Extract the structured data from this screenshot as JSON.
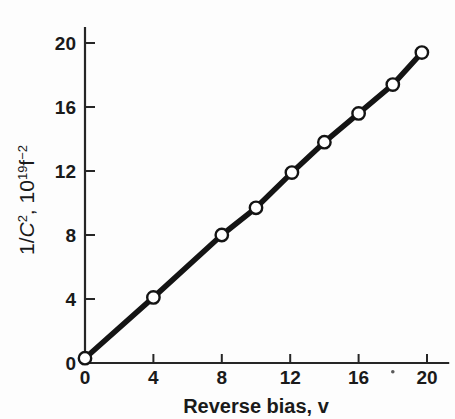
{
  "chart_data": {
    "type": "line",
    "title": "",
    "xlabel": "Reverse bias, v",
    "ylabel": "1/C², 10¹⁹ f⁻²",
    "ylabel_parts": {
      "one_slash": "1/",
      "c_italic": "C",
      "c_exp": "2",
      "comma": ", 10",
      "ten_exp": "19",
      "f": "f",
      "f_exp": "−2"
    },
    "xlim": [
      0,
      21.3
    ],
    "ylim": [
      0,
      21.0
    ],
    "xticks": [
      0,
      4,
      8,
      12,
      16,
      20
    ],
    "yticks": [
      0,
      4,
      8,
      12,
      16,
      20
    ],
    "xtick_labels": [
      "0",
      "4",
      "8",
      "12",
      "16",
      "20"
    ],
    "ytick_labels": [
      "0",
      "4",
      "8",
      "12",
      "16",
      "20"
    ],
    "grid": false,
    "legend": null,
    "series": [
      {
        "name": "1/C^2 vs reverse bias",
        "marker": "open-circle",
        "x": [
          0.0,
          4.0,
          8.0,
          10.0,
          12.1,
          14.0,
          16.0,
          18.0,
          19.7
        ],
        "y": [
          0.3,
          4.1,
          8.0,
          9.7,
          11.9,
          13.8,
          15.6,
          17.4,
          19.4
        ]
      }
    ],
    "annotations": [
      {
        "name": "stray-ink-dot",
        "x": 18.0,
        "y": -0.55
      }
    ],
    "colors": {
      "line": "#141414",
      "marker_face": "#ffffff",
      "marker_edge": "#141414",
      "axis": "#262626",
      "text": "#1a1a1a",
      "background": "#fdfdfd"
    }
  }
}
